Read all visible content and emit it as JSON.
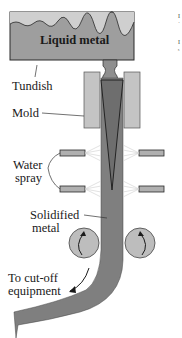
{
  "diagram": {
    "labels": {
      "liquid_metal": "Liquid metal",
      "tundish": "Tundish",
      "mold": "Mold",
      "water_spray_line1": "Water",
      "water_spray_line2": "spray",
      "solidified_line1": "Solidified",
      "solidified_line2": "metal",
      "cutoff_line1": "To cut-off",
      "cutoff_line2": "equipment"
    },
    "colors": {
      "liquid_metal": "#8c8c8c",
      "tundish_fill": "#a3a3a3",
      "mold": "#c4c4c4",
      "strand": "#7f7f7f",
      "rollers": "#bdbdbd",
      "spray_nozzle": "#b0b0b0",
      "outline": "#2a2a2a"
    },
    "corner_marks": [
      "I",
      "ˈ",
      "I",
      "ˢ"
    ]
  }
}
